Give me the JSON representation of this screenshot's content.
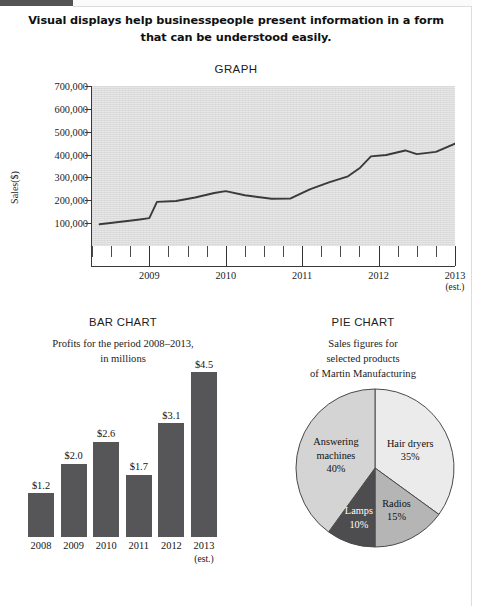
{
  "page": {
    "headline": "Visual displays help businesspeople present information in a form that can be understood easily.",
    "credit": "© CENGAGE LEARNING 2014"
  },
  "chart_data": [
    {
      "type": "line",
      "title": "GRAPH",
      "xlabel": "",
      "ylabel": "Sales($)",
      "ylim": [
        0,
        700000
      ],
      "yticks": [
        "700,000",
        "600,000",
        "500,000",
        "400,000",
        "300,000",
        "200,000",
        "100,000"
      ],
      "ytick_values": [
        700000,
        600000,
        500000,
        400000,
        300000,
        200000,
        100000
      ],
      "xticks": [
        "2009",
        "2010",
        "2011",
        "2012",
        "2013"
      ],
      "xtick_note": "(est.)",
      "grid": false,
      "legend": "none",
      "minor_ticks_per_interval": 3,
      "x": [
        2008.35,
        2008.6,
        2008.85,
        2009.0,
        2009.1,
        2009.35,
        2009.6,
        2009.85,
        2010.0,
        2010.25,
        2010.6,
        2010.85,
        2011.1,
        2011.35,
        2011.6,
        2011.75,
        2011.9,
        2012.1,
        2012.35,
        2012.5,
        2012.75,
        2013.0
      ],
      "values": [
        95000,
        105000,
        115000,
        122000,
        193000,
        197000,
        212000,
        232000,
        240000,
        222000,
        207000,
        208000,
        248000,
        278000,
        305000,
        340000,
        392000,
        398000,
        418000,
        402000,
        412000,
        448000
      ]
    },
    {
      "type": "bar",
      "title": "BAR CHART",
      "subtitle": "Profits for the period 2008–2013,\nin millions",
      "subtitle_line1": "Profits for the period 2008–2013,",
      "subtitle_line2": "in millions",
      "categories": [
        "2008",
        "2009",
        "2010",
        "2011",
        "2012",
        "2013"
      ],
      "category_notes": [
        "",
        "",
        "",
        "",
        "",
        "(est.)"
      ],
      "values": [
        1.2,
        2.0,
        2.6,
        1.7,
        3.1,
        4.5
      ],
      "value_labels": [
        "$1.2",
        "$2.0",
        "$2.6",
        "$1.7",
        "$3.1",
        "$4.5"
      ],
      "ylim": [
        0,
        4.5
      ],
      "bar_color": "#565557",
      "grid": false
    },
    {
      "type": "pie",
      "title": "PIE CHART",
      "subtitle_line1": "Sales figures for",
      "subtitle_line2": "selected products",
      "subtitle_line3": "of Martin Manufacturing",
      "labels": [
        "Hair dryers",
        "Radios",
        "Lamps",
        "Answering machines"
      ],
      "values": [
        35,
        15,
        10,
        40
      ],
      "value_labels": [
        "35%",
        "15%",
        "10%",
        "40%"
      ],
      "slice_colors": [
        "#ebebeb",
        "#b5b5b5",
        "#4d4c4e",
        "#d4d4d4"
      ],
      "start_angle_deg": 0,
      "legend": "inside-slices",
      "slice_label_lines": [
        [
          "Hair dryers",
          "35%"
        ],
        [
          "Radios",
          "15%"
        ],
        [
          "Lamps",
          "10%"
        ],
        [
          "Answering",
          "machines",
          "40%"
        ]
      ]
    }
  ]
}
